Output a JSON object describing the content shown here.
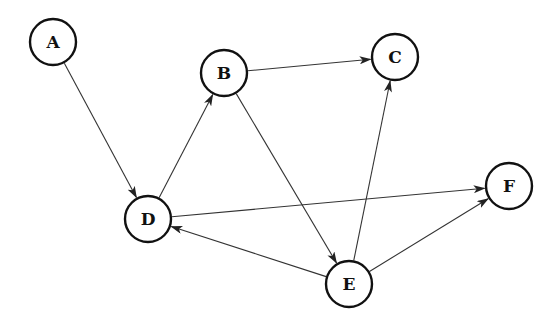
{
  "graph": {
    "type": "directed",
    "node_radius": 23,
    "colors": {
      "node_stroke": "#111111",
      "node_fill": "#ffffff",
      "edge": "#333333",
      "label": "#111111"
    },
    "nodes": [
      {
        "id": "A",
        "label": "A",
        "x": 53,
        "y": 42
      },
      {
        "id": "B",
        "label": "B",
        "x": 224,
        "y": 73
      },
      {
        "id": "C",
        "label": "C",
        "x": 395,
        "y": 57
      },
      {
        "id": "D",
        "label": "D",
        "x": 148,
        "y": 219
      },
      {
        "id": "E",
        "label": "E",
        "x": 349,
        "y": 284
      },
      {
        "id": "F",
        "label": "F",
        "x": 509,
        "y": 186
      }
    ],
    "edges": [
      {
        "from": "A",
        "to": "D"
      },
      {
        "from": "D",
        "to": "B"
      },
      {
        "from": "B",
        "to": "C"
      },
      {
        "from": "B",
        "to": "E"
      },
      {
        "from": "E",
        "to": "C"
      },
      {
        "from": "D",
        "to": "F"
      },
      {
        "from": "E",
        "to": "D"
      },
      {
        "from": "E",
        "to": "F"
      }
    ]
  }
}
